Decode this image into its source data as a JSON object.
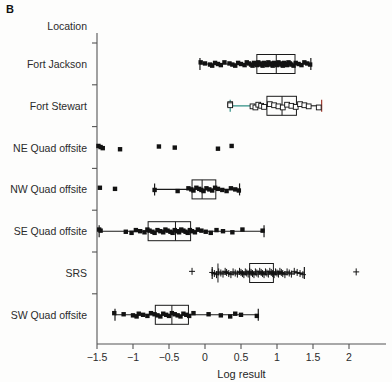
{
  "panel": {
    "label": "B"
  },
  "axes": {
    "y_header": "Location",
    "x_title": "Log result",
    "x_ticks": [
      "−1.5",
      "−1",
      "−0.5",
      "0",
      "0.5",
      "1",
      "1.5",
      "2"
    ],
    "x_tick_values": [
      -1.5,
      -1,
      -0.5,
      0,
      0.5,
      1,
      1.5,
      2
    ],
    "xlim": [
      -1.62,
      2.22
    ],
    "categories": [
      "Fort Jackson",
      "Fort Stewart",
      "NE Quad offsite",
      "NW Quad offsite",
      "SE Quad offsite",
      "SRS",
      "SW Quad offsite"
    ]
  },
  "chart_data": {
    "type": "boxplot",
    "title": "",
    "xlabel": "Log result",
    "ylabel": "Location",
    "xlim": [
      -1.62,
      2.22
    ],
    "grid": false,
    "legend": null,
    "orientation": "horizontal",
    "groups": [
      {
        "name": "Fort Jackson",
        "marker": "filled-square",
        "whisker_color": "#1a1a1a",
        "box": {
          "q1": 0.72,
          "median": 0.99,
          "q3": 1.25,
          "whisker_low": -0.07,
          "whisker_high": 1.47
        },
        "points": [
          -0.06,
          0.0,
          0.07,
          0.1,
          0.14,
          0.18,
          0.22,
          0.27,
          0.34,
          0.38,
          0.42,
          0.46,
          0.5,
          0.55,
          0.58,
          0.61,
          0.64,
          0.66,
          0.68,
          0.7,
          0.72,
          0.74,
          0.76,
          0.78,
          0.8,
          0.82,
          0.84,
          0.86,
          0.88,
          0.9,
          0.92,
          0.94,
          0.96,
          0.98,
          1.0,
          1.02,
          1.04,
          1.06,
          1.08,
          1.1,
          1.12,
          1.14,
          1.16,
          1.18,
          1.2,
          1.23,
          1.26,
          1.3,
          1.34,
          1.38,
          1.42,
          1.46
        ]
      },
      {
        "name": "Fort Stewart",
        "marker": "open-square",
        "whisker_color": "#2f8f85",
        "box": {
          "q1": 0.86,
          "median": 1.07,
          "q3": 1.27,
          "whisker_low": 0.35,
          "whisker_high": 1.62
        },
        "points": [
          0.35,
          0.35,
          0.66,
          0.7,
          0.74,
          0.78,
          0.82,
          0.9,
          0.96,
          1.02,
          1.08,
          1.14,
          1.2,
          1.26,
          1.32,
          1.38,
          1.44,
          1.58
        ]
      },
      {
        "name": "NE Quad offsite",
        "marker": "filled-square",
        "whisker_color": null,
        "box": null,
        "points": [
          -1.48,
          -1.45,
          -1.42,
          -1.18,
          -0.64,
          -0.42,
          0.18,
          0.37
        ]
      },
      {
        "name": "NW Quad offsite",
        "marker": "filled-square",
        "whisker_color": "#1a1a1a",
        "box": {
          "q1": -0.18,
          "median": -0.04,
          "q3": 0.15,
          "whisker_low": -0.7,
          "whisker_high": 0.48
        },
        "points": [
          -1.46,
          -1.25,
          -0.7,
          -0.38,
          -0.23,
          -0.19,
          -0.16,
          -0.12,
          -0.08,
          -0.05,
          -0.02,
          0.02,
          0.06,
          0.1,
          0.14,
          0.18,
          0.24,
          0.3,
          0.36,
          0.42,
          0.47
        ]
      },
      {
        "name": "SE Quad offsite",
        "marker": "filled-square",
        "whisker_color": "#1a1a1a",
        "box": {
          "q1": -0.79,
          "median": -0.41,
          "q3": -0.2,
          "whisker_low": -1.47,
          "whisker_high": 0.82
        },
        "points": [
          -1.47,
          -1.45,
          -1.1,
          -1.02,
          -0.96,
          -0.9,
          -0.84,
          -0.8,
          -0.77,
          -0.73,
          -0.7,
          -0.66,
          -0.62,
          -0.58,
          -0.55,
          -0.52,
          -0.48,
          -0.45,
          -0.42,
          -0.39,
          -0.36,
          -0.33,
          -0.3,
          -0.27,
          -0.24,
          -0.21,
          -0.18,
          -0.14,
          -0.1,
          -0.05,
          0.01,
          0.08,
          0.16,
          0.25,
          0.38,
          0.52,
          0.8
        ]
      },
      {
        "name": "SRS",
        "marker": "plus",
        "whisker_color": "#1a1a1a",
        "box": {
          "q1": 0.62,
          "median": 0.18,
          "q3": 0.95,
          "whisker_low": 0.1,
          "whisker_high": 1.38
        },
        "points": [
          -0.18,
          0.1,
          0.13,
          0.16,
          0.19,
          0.22,
          0.25,
          0.28,
          0.3,
          0.33,
          0.36,
          0.39,
          0.42,
          0.45,
          0.48,
          0.5,
          0.52,
          0.54,
          0.56,
          0.58,
          0.6,
          0.62,
          0.64,
          0.66,
          0.68,
          0.7,
          0.72,
          0.74,
          0.76,
          0.78,
          0.8,
          0.82,
          0.84,
          0.86,
          0.88,
          0.9,
          0.92,
          0.94,
          0.96,
          0.98,
          1.0,
          1.02,
          1.04,
          1.06,
          1.08,
          1.11,
          1.14,
          1.17,
          1.2,
          1.24,
          1.28,
          1.32,
          1.36,
          2.1
        ]
      },
      {
        "name": "SW Quad offsite",
        "marker": "filled-square",
        "whisker_color": "#1a1a1a",
        "box": {
          "q1": -0.69,
          "median": -0.46,
          "q3": -0.23,
          "whisker_low": -1.25,
          "whisker_high": 0.74
        },
        "points": [
          -1.26,
          -1.13,
          -1.0,
          -0.95,
          -0.92,
          -0.86,
          -0.8,
          -0.75,
          -0.7,
          -0.66,
          -0.62,
          -0.58,
          -0.54,
          -0.5,
          -0.46,
          -0.42,
          -0.38,
          -0.34,
          -0.3,
          -0.26,
          -0.22,
          -0.16,
          0.05,
          0.22,
          0.35,
          0.42,
          0.5,
          0.72
        ]
      }
    ]
  }
}
